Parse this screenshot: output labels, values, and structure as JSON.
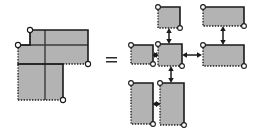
{
  "figure": {
    "title": "Rectilinear polygon decomposition equals rectangle adjacency graph",
    "canvas": {
      "width": 259,
      "height": 134,
      "background": "#ffffff"
    },
    "relation_symbol": "=",
    "style": {
      "rect_fill": "#b3b3b3",
      "solid_edge_color": "#1a1a1a",
      "dotted_edge_color": "#1a1a1a",
      "corner_dot_fill": "#ffffff",
      "corner_dot_stroke": "#1a1a1a",
      "arrow_color": "#1a1a1a",
      "inner_cut_color": "#3a3a3a"
    },
    "left_panel": {
      "label": "staircase-polygon",
      "description": "L-shaped rectilinear polygon partitioned into five rectangles",
      "outline_vertices": [
        [
          30,
          30
        ],
        [
          88,
          30
        ],
        [
          88,
          64
        ],
        [
          63,
          64
        ],
        [
          63,
          100
        ],
        [
          18,
          100
        ],
        [
          18,
          45
        ],
        [
          30,
          45
        ]
      ],
      "cut_lines": [
        {
          "name": "vertical-cut-center",
          "x1": 45,
          "y1": 30,
          "x2": 45,
          "y2": 100
        },
        {
          "name": "horizontal-cut-upper",
          "x1": 18,
          "y1": 45,
          "x2": 88,
          "y2": 45
        },
        {
          "name": "horizontal-cut-lower",
          "x1": 18,
          "y1": 64,
          "x2": 63,
          "y2": 64
        }
      ],
      "corner_dots": [
        {
          "name": "dot-top-left",
          "cx": 30,
          "cy": 30
        },
        {
          "name": "dot-left-notch",
          "cx": 18,
          "cy": 45
        },
        {
          "name": "dot-right-bottom",
          "cx": 88,
          "cy": 64
        },
        {
          "name": "dot-bottom-right",
          "cx": 63,
          "cy": 100
        }
      ]
    },
    "right_panel": {
      "label": "rectangle-adjacency-graph",
      "description": "Five rectangle nodes joined by double-headed adjacency arrows",
      "nodes": [
        {
          "id": "r-top-center",
          "name": "node-top-center",
          "x": 158,
          "y": 7,
          "w": 22,
          "h": 21
        },
        {
          "id": "r-top-right",
          "name": "node-top-right",
          "x": 203,
          "y": 7,
          "w": 41,
          "h": 19
        },
        {
          "id": "r-mid-left",
          "name": "node-mid-left",
          "x": 131,
          "y": 45,
          "w": 22,
          "h": 19
        },
        {
          "id": "r-center",
          "name": "node-center",
          "x": 158,
          "y": 44,
          "w": 24,
          "h": 22
        },
        {
          "id": "r-mid-right",
          "name": "node-mid-right",
          "x": 203,
          "y": 45,
          "w": 41,
          "h": 21
        },
        {
          "id": "r-bottom-left",
          "name": "node-bottom-left",
          "x": 131,
          "y": 83,
          "w": 22,
          "h": 41
        },
        {
          "id": "r-bottom-center",
          "name": "node-bottom-center",
          "x": 160,
          "y": 83,
          "w": 24,
          "h": 42
        }
      ],
      "edges": [
        {
          "name": "edge-top-center-to-center",
          "from": "r-top-center",
          "to": "r-center",
          "orientation": "vertical",
          "double_headed": true
        },
        {
          "name": "edge-top-right-to-mid-right",
          "from": "r-top-right",
          "to": "r-mid-right",
          "orientation": "vertical",
          "double_headed": true
        },
        {
          "name": "edge-mid-left-to-center",
          "from": "r-mid-left",
          "to": "r-center",
          "orientation": "horizontal",
          "double_headed": true
        },
        {
          "name": "edge-center-to-mid-right",
          "from": "r-center",
          "to": "r-mid-right",
          "orientation": "horizontal",
          "double_headed": true
        },
        {
          "name": "edge-center-to-bottom-center",
          "from": "r-center",
          "to": "r-bottom-center",
          "orientation": "vertical",
          "double_headed": true
        },
        {
          "name": "edge-bottom-left-to-bottom-center",
          "from": "r-bottom-left",
          "to": "r-bottom-center",
          "orientation": "horizontal",
          "double_headed": true
        }
      ]
    }
  }
}
